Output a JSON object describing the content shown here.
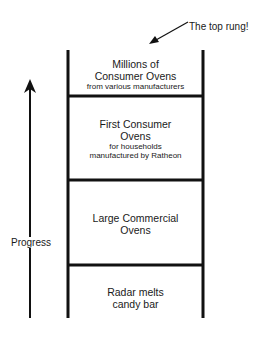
{
  "diagram": {
    "callout": {
      "text": "The top rung!",
      "icon": "arrow-pointer"
    },
    "axis": {
      "label": "Progress",
      "direction": "up",
      "icon": "arrow-up"
    },
    "rungs": [
      {
        "title": "Millions of Consumer Ovens",
        "title_lines": [
          "Millions of",
          "Consumer Ovens"
        ],
        "subtitle": "from various manufacturers"
      },
      {
        "title": "First Consumer Ovens",
        "title_lines": [
          "First Consumer",
          "Ovens"
        ],
        "subtitle_lines": [
          "for households",
          "manufactured by Ratheon"
        ]
      },
      {
        "title": "Large Commercial Ovens",
        "title_lines": [
          "Large Commercial",
          "Ovens"
        ]
      },
      {
        "title": "Radar melts candy bar",
        "title_lines": [
          "Radar melts",
          "candy bar"
        ]
      }
    ],
    "colors": {
      "line": "#111111",
      "background": "#ffffff"
    }
  }
}
